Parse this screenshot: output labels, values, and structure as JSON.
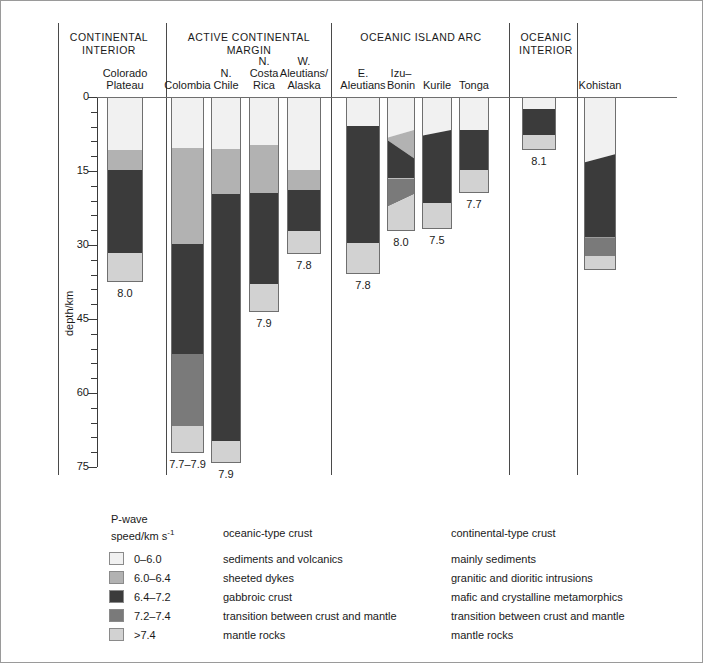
{
  "figure": {
    "y_axis_title": "depth/km",
    "y_ticks": [
      "0",
      "15",
      "30",
      "45",
      "60",
      "75"
    ]
  },
  "groups": [
    {
      "name": "CONTINENTAL\nINTERIOR",
      "line1": "CONTINENTAL",
      "line2": "INTERIOR"
    },
    {
      "name": "ACTIVE CONTINENTAL MARGIN",
      "line1": "ACTIVE CONTINENTAL",
      "line2": "MARGIN"
    },
    {
      "name": "OCEANIC ISLAND ARC",
      "line1": "OCEANIC ISLAND ARC",
      "line2": ""
    },
    {
      "name": "OCEANIC INTERIOR",
      "line1": "OCEANIC",
      "line2": "INTERIOR"
    },
    {
      "name": "",
      "line1": "",
      "line2": ""
    }
  ],
  "legend": {
    "title_l1": "P-wave",
    "title_l2": "speed/km s",
    "title_sup": "-1",
    "col_oceanic": "oceanic-type crust",
    "col_continental": "continental-type crust",
    "rows": [
      {
        "speed": "0–6.0",
        "color": "#f1f1f1",
        "oceanic": "sediments and volcanics",
        "continental": "mainly sediments"
      },
      {
        "speed": "6.0–6.4",
        "color": "#b2b2b2",
        "oceanic": "sheeted dykes",
        "continental": "granitic and dioritic intrusions"
      },
      {
        "speed": "6.4–7.2",
        "color": "#3b3b3b",
        "oceanic": "gabbroic crust",
        "continental": "mafic and crystalline metamorphics"
      },
      {
        "speed": "7.2–7.4",
        "color": "#7a7a7a",
        "oceanic": "transition between crust and mantle",
        "continental": "transition between crust and mantle"
      },
      {
        "speed": ">7.4",
        "color": "#d2d2d2",
        "oceanic": "mantle rocks",
        "continental": "mantle rocks"
      }
    ]
  },
  "chart_data": {
    "type": "bar",
    "title": "",
    "xlabel": "",
    "ylabel": "depth/km",
    "ylim": [
      0,
      75
    ],
    "y_ticks_major": [
      0,
      15,
      30,
      45,
      60,
      75
    ],
    "y_tick_minor_step": 3,
    "grid": false,
    "legend_position": "bottom",
    "units": "km depth",
    "layer_classes": [
      "0-6.0",
      "6.0-6.4",
      "6.4-7.2",
      "7.2-7.4",
      ">7.4"
    ],
    "columns": [
      {
        "id": "colorado-plateau",
        "label_l1": "Colorado",
        "label_l2": "Plateau",
        "group": "CONTINENTAL INTERIOR",
        "pn_velocity": "8.0",
        "layers": [
          {
            "class": "0-6.0",
            "top": 0.0,
            "bottom": 10.5,
            "color": "#f1f1f1"
          },
          {
            "class": "6.0-6.4",
            "top": 10.5,
            "bottom": 14.5,
            "color": "#b2b2b2"
          },
          {
            "class": "6.4-7.2",
            "top": 14.5,
            "bottom": 31.5,
            "color": "#3b3b3b"
          },
          {
            "class": ">7.4",
            "top": 31.5,
            "bottom": 37.5,
            "color": "#d2d2d2"
          }
        ]
      },
      {
        "id": "colombia",
        "label_l1": "Colombia",
        "label_l2": "",
        "group": "ACTIVE CONTINENTAL MARGIN",
        "pn_velocity": "7.7–7.9",
        "layers": [
          {
            "class": "0-6.0",
            "top": 0.0,
            "bottom": 10.2,
            "color": "#f1f1f1"
          },
          {
            "class": "6.0-6.4",
            "top": 10.2,
            "bottom": 29.5,
            "color": "#b2b2b2"
          },
          {
            "class": "6.4-7.2",
            "top": 29.5,
            "bottom": 51.8,
            "color": "#3b3b3b"
          },
          {
            "class": "7.2-7.4",
            "top": 51.8,
            "bottom": 66.5,
            "color": "#7a7a7a"
          },
          {
            "class": ">7.4",
            "top": 66.5,
            "bottom": 72.2,
            "color": "#d2d2d2"
          }
        ]
      },
      {
        "id": "n-chile",
        "label_l1": "N.",
        "label_l2": "Chile",
        "group": "ACTIVE CONTINENTAL MARGIN",
        "pn_velocity": "7.9",
        "layers": [
          {
            "class": "0-6.0",
            "top": 0.0,
            "bottom": 10.4,
            "color": "#f1f1f1"
          },
          {
            "class": "6.0-6.4",
            "top": 10.4,
            "bottom": 19.5,
            "color": "#b2b2b2"
          },
          {
            "class": "6.4-7.2",
            "top": 19.5,
            "bottom": 69.5,
            "color": "#3b3b3b"
          },
          {
            "class": ">7.4",
            "top": 69.5,
            "bottom": 74.2,
            "color": "#d2d2d2"
          }
        ]
      },
      {
        "id": "n-costa-rica",
        "label_l1": "N.",
        "label_l2": "Costa",
        "label_l3": "Rica",
        "group": "ACTIVE CONTINENTAL MARGIN",
        "pn_velocity": "7.9",
        "layers": [
          {
            "class": "0-6.0",
            "top": 0.0,
            "bottom": 9.6,
            "color": "#f1f1f1"
          },
          {
            "class": "6.0-6.4",
            "top": 9.6,
            "bottom": 19.2,
            "color": "#b2b2b2"
          },
          {
            "class": "6.4-7.2",
            "top": 19.2,
            "bottom": 37.8,
            "color": "#3b3b3b"
          },
          {
            "class": ">7.4",
            "top": 37.8,
            "bottom": 43.6,
            "color": "#d2d2d2"
          }
        ]
      },
      {
        "id": "w-aleutians-alaska",
        "label_l1": "W.",
        "label_l2": "Aleutians/",
        "label_l3": "Alaska",
        "group": "ACTIVE CONTINENTAL MARGIN",
        "pn_velocity": "7.8",
        "layers": [
          {
            "class": "0-6.0",
            "top": 0.0,
            "bottom": 14.6,
            "color": "#f1f1f1"
          },
          {
            "class": "6.0-6.4",
            "top": 14.6,
            "bottom": 18.6,
            "color": "#b2b2b2"
          },
          {
            "class": "6.4-7.2",
            "top": 18.6,
            "bottom": 26.9,
            "color": "#3b3b3b"
          },
          {
            "class": ">7.4",
            "top": 26.9,
            "bottom": 31.8,
            "color": "#d2d2d2"
          }
        ]
      },
      {
        "id": "e-aleutians",
        "label_l1": "E.",
        "label_l2": "Aleutians",
        "group": "OCEANIC ISLAND ARC",
        "pn_velocity": "7.8",
        "layers": [
          {
            "class": "0-6.0",
            "top": 0.0,
            "bottom": 5.7,
            "color": "#f1f1f1"
          },
          {
            "class": "6.4-7.2",
            "top": 5.7,
            "bottom": 29.3,
            "color": "#3b3b3b"
          },
          {
            "class": ">7.4",
            "top": 29.3,
            "bottom": 35.8,
            "color": "#d2d2d2"
          }
        ]
      },
      {
        "id": "izu-bonin",
        "label_l1": "Izu–",
        "label_l2": "Bonin",
        "group": "OCEANIC ISLAND ARC",
        "pn_velocity": "8.0",
        "wedged": true,
        "layers": [
          {
            "class": "0-6.0",
            "top": 0.0,
            "bottom": 8.0,
            "top_right": 0.0,
            "bottom_right": 6.5,
            "color": "#f1f1f1"
          },
          {
            "class": "6.0-6.4",
            "top": 8.0,
            "bottom": 8.6,
            "top_right": 6.5,
            "bottom_right": 12.2,
            "color": "#b2b2b2"
          },
          {
            "class": "6.4-7.2",
            "top": 8.6,
            "bottom": 16.3,
            "top_right": 12.2,
            "bottom_right": 16.3,
            "color": "#3b3b3b"
          },
          {
            "class": "7.2-7.4",
            "top": 16.3,
            "bottom": 22.0,
            "top_right": 16.3,
            "bottom_right": 19.5,
            "color": "#7a7a7a"
          },
          {
            "class": ">7.4",
            "top": 22.0,
            "bottom": 27.2,
            "top_right": 19.5,
            "bottom_right": 27.2,
            "color": "#d2d2d2"
          }
        ]
      },
      {
        "id": "kurile",
        "label_l1": "Kurile",
        "label_l2": "",
        "group": "OCEANIC ISLAND ARC",
        "pn_velocity": "7.5",
        "wedged": true,
        "layers": [
          {
            "class": "0-6.0",
            "top": 0.0,
            "bottom": 7.6,
            "top_right": 0.0,
            "bottom_right": 6.5,
            "color": "#f1f1f1"
          },
          {
            "class": "6.4-7.2",
            "top": 7.6,
            "bottom": 21.3,
            "top_right": 6.5,
            "bottom_right": 21.3,
            "color": "#3b3b3b"
          },
          {
            "class": ">7.4",
            "top": 21.3,
            "bottom": 26.8,
            "top_right": 21.3,
            "bottom_right": 26.8,
            "color": "#d2d2d2"
          }
        ]
      },
      {
        "id": "tonga",
        "label_l1": "Tonga",
        "label_l2": "",
        "group": "OCEANIC ISLAND ARC",
        "pn_velocity": "7.7",
        "layers": [
          {
            "class": "0-6.0",
            "top": 0.0,
            "bottom": 6.5,
            "color": "#f1f1f1"
          },
          {
            "class": "6.4-7.2",
            "top": 6.5,
            "bottom": 14.6,
            "color": "#3b3b3b"
          },
          {
            "class": ">7.4",
            "top": 14.6,
            "bottom": 19.5,
            "color": "#d2d2d2"
          }
        ]
      },
      {
        "id": "oceanic-interior",
        "label_l1": "",
        "label_l2": "",
        "group": "OCEANIC INTERIOR",
        "pn_velocity": "8.1",
        "layers": [
          {
            "class": "0-6.0",
            "top": 0.0,
            "bottom": 2.2,
            "color": "#f1f1f1"
          },
          {
            "class": "6.4-7.2",
            "top": 2.2,
            "bottom": 7.5,
            "color": "#3b3b3b"
          },
          {
            "class": ">7.4",
            "top": 7.5,
            "bottom": 10.8,
            "color": "#d2d2d2"
          }
        ]
      },
      {
        "id": "kohistan",
        "label_l1": "Kohistan",
        "label_l2": "",
        "group": "",
        "pn_velocity": "",
        "wedged": true,
        "layers": [
          {
            "class": "0-6.0",
            "top": 0.0,
            "bottom": 13.0,
            "top_right": 0.0,
            "bottom_right": 11.4,
            "color": "#f1f1f1"
          },
          {
            "class": "6.4-7.2",
            "top": 13.0,
            "bottom": 28.3,
            "top_right": 11.4,
            "bottom_right": 28.3,
            "color": "#3b3b3b"
          },
          {
            "class": "7.2-7.4",
            "top": 28.3,
            "bottom": 32.0,
            "top_right": 28.3,
            "bottom_right": 32.0,
            "color": "#7a7a7a"
          },
          {
            "class": ">7.4",
            "top": 32.0,
            "bottom": 35.0,
            "top_right": 32.0,
            "bottom_right": 35.0,
            "color": "#d2d2d2"
          }
        ]
      }
    ]
  }
}
